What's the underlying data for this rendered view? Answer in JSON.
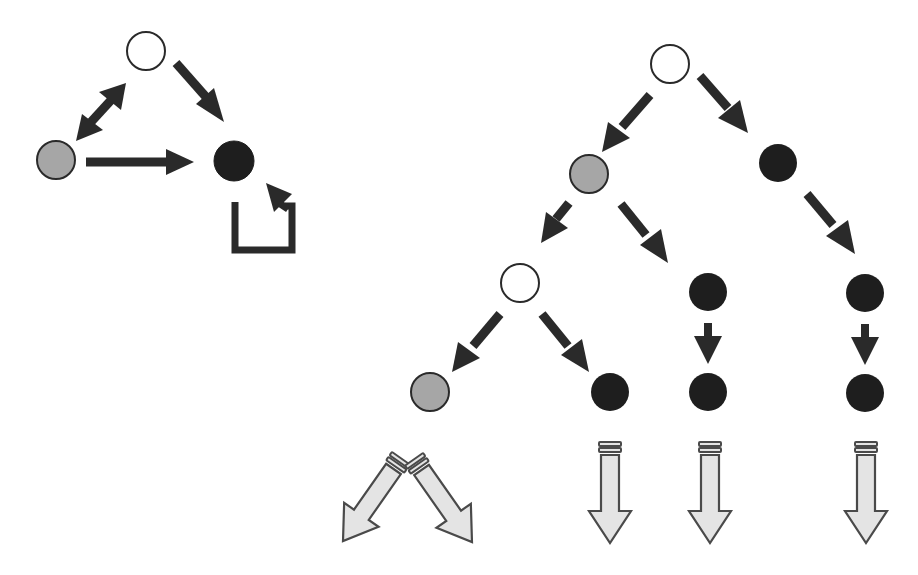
{
  "colors": {
    "white_fill": "#ffffff",
    "gray_fill": "#a6a6a6",
    "black_fill": "#1e1e1e",
    "outline": "#2a2a2a",
    "arrow": "#2a2a2a",
    "outcome_fill": "#e4e4e4",
    "outcome_stroke": "#4a4a4a"
  },
  "state_diagram": {
    "nodes": [
      {
        "id": "s-white",
        "state": "white",
        "cx": 146,
        "cy": 51
      },
      {
        "id": "s-gray",
        "state": "gray",
        "cx": 56,
        "cy": 160
      },
      {
        "id": "s-black",
        "state": "black",
        "cx": 234,
        "cy": 161
      }
    ],
    "edges": [
      {
        "from": "s-white",
        "to": "s-black",
        "type": "directed"
      },
      {
        "from": "s-white",
        "to": "s-gray",
        "type": "bidirectional"
      },
      {
        "from": "s-gray",
        "to": "s-black",
        "type": "directed"
      },
      {
        "from": "s-black",
        "to": "s-black",
        "type": "self-loop"
      }
    ]
  },
  "tree_diagram": {
    "nodes": [
      {
        "id": "root",
        "state": "white",
        "cx": 670,
        "cy": 64
      },
      {
        "id": "l1-gray",
        "state": "gray",
        "cx": 589,
        "cy": 174
      },
      {
        "id": "l1-black",
        "state": "black",
        "cx": 778,
        "cy": 163
      },
      {
        "id": "l2-white",
        "state": "white",
        "cx": 520,
        "cy": 283
      },
      {
        "id": "l2-black-a",
        "state": "black",
        "cx": 708,
        "cy": 292
      },
      {
        "id": "l2-black-b",
        "state": "black",
        "cx": 865,
        "cy": 293
      },
      {
        "id": "l3-gray",
        "state": "gray",
        "cx": 430,
        "cy": 392
      },
      {
        "id": "l3-black-a",
        "state": "black",
        "cx": 610,
        "cy": 392
      },
      {
        "id": "l3-black-b",
        "state": "black",
        "cx": 708,
        "cy": 392
      },
      {
        "id": "l3-black-c",
        "state": "black",
        "cx": 865,
        "cy": 393
      }
    ],
    "edges": [
      {
        "from": "root",
        "to": "l1-gray"
      },
      {
        "from": "root",
        "to": "l1-black"
      },
      {
        "from": "l1-gray",
        "to": "l2-white"
      },
      {
        "from": "l1-gray",
        "to": "l2-black-a"
      },
      {
        "from": "l1-black",
        "to": "l2-black-b"
      },
      {
        "from": "l2-white",
        "to": "l3-gray"
      },
      {
        "from": "l2-white",
        "to": "l3-black-a"
      },
      {
        "from": "l2-black-a",
        "to": "l3-black-b"
      },
      {
        "from": "l2-black-b",
        "to": "l3-black-c"
      }
    ],
    "continuation_arrows": [
      {
        "id": "cont-1",
        "direction": "down-left",
        "origin_node": "l3-gray"
      },
      {
        "id": "cont-2",
        "direction": "down-right",
        "origin_node": "l3-gray"
      },
      {
        "id": "cont-3",
        "direction": "down",
        "origin_node": "l3-black-a"
      },
      {
        "id": "cont-4",
        "direction": "down",
        "origin_node": "l3-black-b"
      },
      {
        "id": "cont-5",
        "direction": "down",
        "origin_node": "l3-black-c"
      }
    ]
  }
}
